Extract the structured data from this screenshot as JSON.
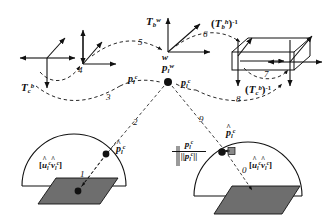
{
  "figure": {
    "type": "transformation-chain-diagram",
    "background_color": "#ffffff",
    "line_color": "#111111",
    "plane_fill": "#6e6e6e",
    "box_fill": "#d8d8d8"
  },
  "labels": {
    "world_origin": "w",
    "T_b_w": {
      "base": "T",
      "sub": "b",
      "sup": "w"
    },
    "T_b_h_inv": {
      "base": "T",
      "sub": "b",
      "sup": "h",
      "inv": "-1"
    },
    "T_c_b": {
      "base": "T",
      "sub": "c",
      "sup": "b"
    },
    "T_c_b_inv": {
      "base": "T",
      "sub": "c",
      "sup": "b",
      "inv": "-1"
    },
    "p_l_w": {
      "base": "p",
      "sub": "l",
      "sup": "w"
    },
    "p_l_c_left": {
      "base": "p",
      "sub": "l",
      "sup": "c"
    },
    "p_l_c_right": {
      "base": "p",
      "sub": "l",
      "sup": "c"
    },
    "p_hat_l_c_left": {
      "base": "p",
      "sub": "l",
      "sup": "c",
      "hat": "^"
    },
    "p_hat_l_c_right": {
      "base": "p",
      "sub": "l",
      "sup": "c",
      "hat": "^"
    },
    "normalized_fraction": {
      "numerator": {
        "base": "p",
        "sub": "l",
        "sup": "c"
      },
      "denominator": {
        "base": "p",
        "sub": "l",
        "sup": "c",
        "norm": "||"
      }
    },
    "uv_bracket_left": {
      "open": "[",
      "u": {
        "base": "u",
        "sub": "l",
        "sup": "c",
        "hat": "^"
      },
      "v": {
        "base": "v",
        "sub": "l",
        "sup": "c",
        "hat": "^"
      },
      "close": "]"
    },
    "uv_bracket_right": {
      "open": "[",
      "u": {
        "base": "u",
        "sub": "l",
        "sup": "c",
        "hat": "^"
      },
      "v": {
        "base": "v",
        "sub": "l",
        "sup": "c",
        "hat": "^"
      },
      "close": "]"
    }
  },
  "step_numbers": {
    "n0": "0",
    "n1": "1",
    "n2": "2",
    "n3": "3",
    "n4": "4",
    "n5": "5",
    "n6": "6",
    "n7": "7",
    "n8": "8",
    "n9": "9"
  }
}
